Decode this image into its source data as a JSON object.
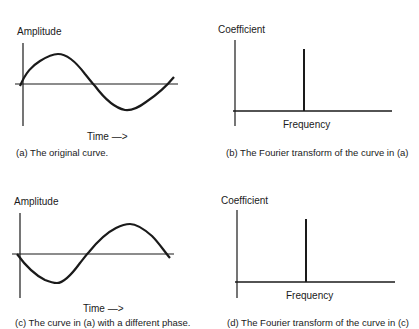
{
  "panels": [
    {
      "id": "a",
      "ylabel": "Amplitude",
      "xlabel": "Time —>",
      "caption": "(a)  The original curve."
    },
    {
      "id": "b",
      "ylabel": "Coefficient",
      "xlabel": "Frequency",
      "caption": "(b) The Fourier transform of the curve in (a)"
    },
    {
      "id": "c",
      "ylabel": "Amplitude",
      "xlabel": "Time —>",
      "caption": "(c) The curve in (a) with a different phase."
    },
    {
      "id": "d",
      "ylabel": "Coefficient",
      "xlabel": "Frequency",
      "caption": "(d) The Fourier transform of the curve in (c)"
    }
  ],
  "colors": {
    "ink": "#1a1a1a",
    "background": "#ffffff"
  }
}
